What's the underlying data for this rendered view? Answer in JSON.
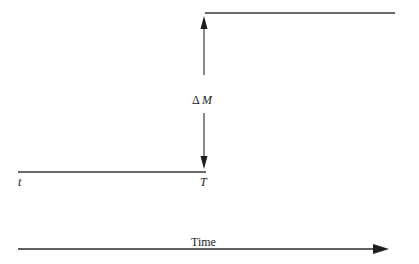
{
  "diagram": {
    "type": "step-change-timeline",
    "labels": {
      "delta": "Δ M",
      "delta_symbol": "Δ",
      "delta_variable": "M",
      "start_time": "t",
      "end_time": "T",
      "axis": "Time"
    },
    "elements": {
      "low_level_line": {
        "from": "t",
        "to": "T"
      },
      "high_level_line": {
        "from": "T",
        "to": "end"
      },
      "delta_arrow": {
        "direction": "bidirectional-vertical",
        "label": "Δ M"
      },
      "time_axis": {
        "direction": "left-to-right",
        "label": "Time"
      }
    },
    "colors": {
      "line": "#2a2a2a",
      "text": "#222222",
      "background": "#ffffff"
    }
  }
}
